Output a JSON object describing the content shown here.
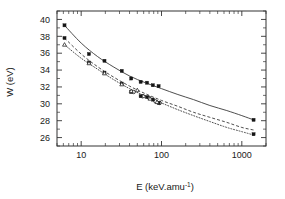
{
  "chart_data": {
    "type": "scatter",
    "title": "",
    "subtitle": "",
    "xlabel_text": "E (keV.amu",
    "xlabel_sup": "-1",
    "xlabel_tail": ")",
    "xlabel": "E (keV.amu-1)",
    "ylabel": "W (eV)",
    "xscale": "log",
    "yscale": "linear",
    "xlim": [
      5,
      2000
    ],
    "ylim": [
      25,
      41
    ],
    "grid": false,
    "legend": "none",
    "xticks": [
      10,
      100,
      1000
    ],
    "xtick_labels": [
      "10",
      "100",
      "1000"
    ],
    "yticks": [
      26,
      28,
      30,
      32,
      34,
      36,
      38,
      40
    ],
    "ytick_labels": [
      "26",
      "28",
      "30",
      "32",
      "34",
      "36",
      "38",
      "40"
    ],
    "series": [
      {
        "name": "series-1-solid-squares",
        "marker": "filled-square",
        "line": "solid",
        "points": [
          {
            "x": 6.2,
            "y": 39.3
          },
          {
            "x": 12.5,
            "y": 35.9
          },
          {
            "x": 19.5,
            "y": 35.1
          },
          {
            "x": 32.0,
            "y": 33.9
          },
          {
            "x": 42.0,
            "y": 33.0
          },
          {
            "x": 55.0,
            "y": 32.6
          },
          {
            "x": 66.0,
            "y": 32.5
          },
          {
            "x": 78.0,
            "y": 32.2
          },
          {
            "x": 92.0,
            "y": 32.1
          },
          {
            "x": 1400.0,
            "y": 28.1
          }
        ]
      },
      {
        "name": "series-2-dashed-squares",
        "marker": "filled-square",
        "line": "dashed",
        "points": [
          {
            "x": 6.2,
            "y": 37.8
          },
          {
            "x": 12.5,
            "y": 34.9
          },
          {
            "x": 19.5,
            "y": 33.7
          },
          {
            "x": 32.0,
            "y": 32.4
          },
          {
            "x": 42.0,
            "y": 31.4
          },
          {
            "x": 55.0,
            "y": 30.9
          },
          {
            "x": 66.0,
            "y": 30.8
          },
          {
            "x": 78.0,
            "y": 30.5
          },
          {
            "x": 92.0,
            "y": 30.1
          },
          {
            "x": 1400.0,
            "y": 26.4
          }
        ]
      },
      {
        "name": "series-3-dotted-open",
        "marker": "open-triangle",
        "line": "dotted",
        "points": [
          {
            "x": 6.2,
            "y": 37.0
          },
          {
            "x": 12.5,
            "y": 34.8
          },
          {
            "x": 19.5,
            "y": 33.6
          },
          {
            "x": 32.0,
            "y": 32.3
          },
          {
            "x": 42.0,
            "y": 31.5
          },
          {
            "x": 50.0,
            "y": 31.6
          },
          {
            "x": 60.0,
            "y": 30.9
          },
          {
            "x": 72.0,
            "y": 30.6
          },
          {
            "x": 88.0,
            "y": 30.2
          }
        ]
      }
    ],
    "open_circles": [
      {
        "x": 45.0,
        "y": 31.4
      },
      {
        "x": 58.0,
        "y": 30.9
      },
      {
        "x": 70.0,
        "y": 30.7
      },
      {
        "x": 84.0,
        "y": 30.3
      },
      {
        "x": 95.0,
        "y": 30.1
      }
    ],
    "curves": [
      {
        "name": "fit-solid",
        "style": "solid",
        "path_points": [
          {
            "x": 6.2,
            "y": 39.3
          },
          {
            "x": 10.0,
            "y": 37.2
          },
          {
            "x": 16.0,
            "y": 35.6
          },
          {
            "x": 25.0,
            "y": 34.4
          },
          {
            "x": 40.0,
            "y": 33.3
          },
          {
            "x": 63.0,
            "y": 32.5
          },
          {
            "x": 100.0,
            "y": 31.8
          },
          {
            "x": 160.0,
            "y": 31.1
          },
          {
            "x": 250.0,
            "y": 30.5
          },
          {
            "x": 400.0,
            "y": 29.8
          },
          {
            "x": 650.0,
            "y": 29.2
          },
          {
            "x": 1000.0,
            "y": 28.6
          },
          {
            "x": 1400.0,
            "y": 28.1
          }
        ]
      },
      {
        "name": "fit-dashed",
        "style": "dashed",
        "path_points": [
          {
            "x": 6.2,
            "y": 37.8
          },
          {
            "x": 10.0,
            "y": 35.9
          },
          {
            "x": 16.0,
            "y": 34.4
          },
          {
            "x": 25.0,
            "y": 33.2
          },
          {
            "x": 40.0,
            "y": 32.1
          },
          {
            "x": 63.0,
            "y": 31.2
          },
          {
            "x": 100.0,
            "y": 30.4
          },
          {
            "x": 160.0,
            "y": 29.7
          },
          {
            "x": 250.0,
            "y": 29.0
          },
          {
            "x": 400.0,
            "y": 28.4
          },
          {
            "x": 650.0,
            "y": 27.8
          },
          {
            "x": 1000.0,
            "y": 27.2
          },
          {
            "x": 1400.0,
            "y": 26.9
          }
        ]
      },
      {
        "name": "fit-dotted",
        "style": "dotted",
        "path_points": [
          {
            "x": 6.2,
            "y": 37.0
          },
          {
            "x": 10.0,
            "y": 35.4
          },
          {
            "x": 16.0,
            "y": 34.1
          },
          {
            "x": 25.0,
            "y": 32.9
          },
          {
            "x": 40.0,
            "y": 31.8
          },
          {
            "x": 63.0,
            "y": 30.9
          },
          {
            "x": 100.0,
            "y": 30.1
          },
          {
            "x": 160.0,
            "y": 29.3
          },
          {
            "x": 250.0,
            "y": 28.6
          },
          {
            "x": 400.0,
            "y": 27.9
          },
          {
            "x": 650.0,
            "y": 27.2
          },
          {
            "x": 1000.0,
            "y": 26.7
          },
          {
            "x": 1400.0,
            "y": 26.3
          }
        ]
      }
    ]
  }
}
